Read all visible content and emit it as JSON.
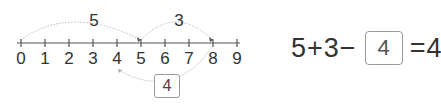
{
  "number_line": {
    "ticks": [
      "0",
      "1",
      "2",
      "3",
      "4",
      "5",
      "6",
      "7",
      "8",
      "9"
    ],
    "origin_x": 21,
    "spacing": 24,
    "axis_y": 43,
    "line_color": "#555555",
    "arc_color": "#bbbbbb"
  },
  "arcs": [
    {
      "label": "5",
      "from": 0,
      "to": 5,
      "direction": "above"
    },
    {
      "label": "3",
      "from": 5,
      "to": 8,
      "direction": "above"
    },
    {
      "label": "4",
      "from": 8,
      "to": 4,
      "direction": "below",
      "boxed": true
    }
  ],
  "equation": {
    "a": "5",
    "op1": "+",
    "b": "3",
    "op2": "−",
    "answer": "4",
    "eq": "=",
    "result": "4"
  }
}
